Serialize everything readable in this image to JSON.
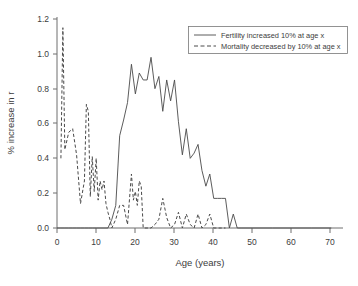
{
  "chart_data": {
    "type": "line",
    "title": "",
    "xlabel": "Age (years)",
    "ylabel": "% increase in r",
    "xlim": [
      0,
      73
    ],
    "ylim": [
      0.0,
      1.25
    ],
    "xticks": [
      0,
      10,
      20,
      30,
      40,
      50,
      60,
      70
    ],
    "yticks": [
      "0.0",
      "0.2",
      "0.4",
      "0.6",
      "0.8",
      "1.0",
      "1.2"
    ],
    "grid": false,
    "legend_position": "top-right",
    "series": [
      {
        "name": "Fertility increased 10% at age x",
        "style": "solid",
        "color": "#4a4a4a",
        "x": [
          0,
          1,
          2,
          3,
          4,
          5,
          6,
          7,
          8,
          9,
          10,
          11,
          12,
          13,
          14,
          15,
          16,
          17,
          18,
          19,
          20,
          21,
          22,
          23,
          24,
          25,
          26,
          27,
          28,
          29,
          30,
          31,
          32,
          33,
          34,
          35,
          36,
          37,
          38,
          39,
          40,
          41,
          42,
          43,
          44,
          45,
          46,
          47,
          50,
          55,
          60,
          65,
          70
        ],
        "values": [
          0.0,
          0.0,
          0.0,
          0.0,
          0.0,
          0.0,
          0.0,
          0.0,
          0.0,
          0.0,
          0.0,
          0.0,
          0.0,
          0.0,
          0.05,
          0.13,
          0.53,
          0.62,
          0.72,
          0.94,
          0.77,
          0.89,
          0.85,
          0.85,
          0.98,
          0.8,
          0.87,
          0.67,
          0.85,
          0.73,
          0.85,
          0.61,
          0.42,
          0.57,
          0.4,
          0.43,
          0.48,
          0.33,
          0.24,
          0.31,
          0.17,
          0.17,
          0.17,
          0.17,
          0.0,
          0.08,
          0.0,
          0.0,
          0.0,
          0.0,
          0.0,
          0.0,
          0.0
        ]
      },
      {
        "name": "Mortality decreased by 10% at age x",
        "style": "dashed",
        "color": "#4a4a4a",
        "x": [
          1,
          1.5,
          2,
          3,
          4,
          5,
          6,
          7,
          7.5,
          8,
          8.5,
          9,
          9.5,
          10,
          10.5,
          11,
          11.5,
          12,
          12.5,
          13,
          13.5,
          14,
          15,
          16,
          17,
          18,
          19,
          19.5,
          20,
          20.5,
          21,
          21.5,
          22,
          23,
          24,
          25,
          26,
          27,
          28,
          29,
          30,
          31,
          32,
          33,
          34,
          35,
          36,
          37,
          38,
          39,
          40,
          41,
          42,
          43
        ],
        "values": [
          0.4,
          1.15,
          0.45,
          0.55,
          0.57,
          0.42,
          0.14,
          0.27,
          0.71,
          0.67,
          0.18,
          0.41,
          0.21,
          0.4,
          0.16,
          0.27,
          0.22,
          0.27,
          0.14,
          0.09,
          0.05,
          0.0,
          0.05,
          0.13,
          0.13,
          0.02,
          0.31,
          0.16,
          0.21,
          0.13,
          0.27,
          0.24,
          0.0,
          0.0,
          0.0,
          0.02,
          0.05,
          0.17,
          0.06,
          0.0,
          0.02,
          0.09,
          0.0,
          0.08,
          0.02,
          0.0,
          0.08,
          0.0,
          0.02,
          0.08,
          0.0,
          0.0,
          0.0,
          0.0
        ]
      }
    ]
  },
  "legend": {
    "entries": [
      {
        "label": "Fertility increased 10% at age x"
      },
      {
        "label": "Mortality decreased by 10% at age x"
      }
    ]
  }
}
